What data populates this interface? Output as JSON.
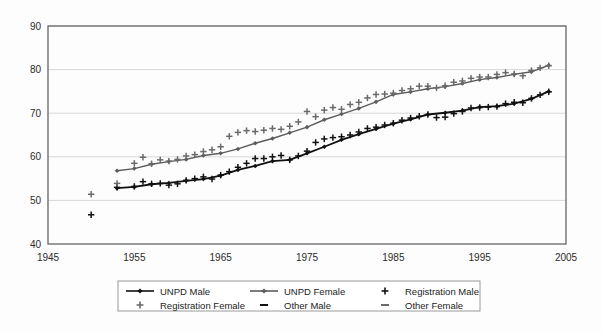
{
  "chart_data": {
    "type": "line",
    "title": "",
    "subtitle": "",
    "xlabel": "",
    "ylabel": "",
    "xlim": [
      1945,
      2005
    ],
    "ylim": [
      40,
      90
    ],
    "xticks": [
      1945,
      1955,
      1965,
      1975,
      1985,
      1995,
      2005
    ],
    "yticks": [
      40,
      50,
      60,
      70,
      80,
      90
    ],
    "grid": true,
    "legend_position": "bottom",
    "colors": {
      "unpd_male": "#111111",
      "unpd_female": "#5c5c5c",
      "registration_male": "#111111",
      "registration_female": "#6a6a6a",
      "gridline": "#d8d8d8",
      "frame": "#666666",
      "background": "#fdfdfd"
    },
    "series": [
      {
        "name": "UNPD Male",
        "marker": "diamond",
        "style": "line-with-markers",
        "color": "#111111",
        "x": [
          1953,
          1955,
          1957,
          1959,
          1961,
          1963,
          1965,
          1967,
          1969,
          1971,
          1973,
          1975,
          1977,
          1979,
          1981,
          1983,
          1985,
          1987,
          1989,
          1991,
          1993,
          1995,
          1997,
          1999,
          2001,
          2003
        ],
        "y": [
          52.8,
          53.1,
          53.7,
          54.0,
          54.5,
          54.9,
          55.7,
          57.0,
          57.9,
          59.0,
          59.3,
          60.8,
          62.3,
          63.9,
          65.2,
          66.4,
          67.6,
          68.6,
          69.7,
          70.1,
          70.6,
          71.4,
          71.6,
          72.2,
          73.3,
          75.0
        ]
      },
      {
        "name": "UNPD Female",
        "marker": "diamond",
        "style": "line-with-markers",
        "color": "#5c5c5c",
        "x": [
          1953,
          1955,
          1957,
          1959,
          1961,
          1963,
          1965,
          1967,
          1969,
          1971,
          1973,
          1975,
          1977,
          1979,
          1981,
          1983,
          1985,
          1987,
          1989,
          1991,
          1993,
          1995,
          1997,
          1999,
          2001,
          2003
        ],
        "y": [
          56.8,
          57.3,
          58.3,
          58.9,
          59.4,
          60.3,
          60.8,
          61.8,
          63.1,
          64.2,
          65.5,
          66.8,
          68.5,
          69.8,
          71.1,
          72.6,
          74.3,
          74.9,
          75.6,
          76.1,
          76.8,
          77.7,
          78.2,
          78.9,
          79.5,
          81.0
        ]
      },
      {
        "name": "Registration Male",
        "marker": "plus",
        "style": "markers-only",
        "color": "#111111",
        "x": [
          1950,
          1953,
          1955,
          1956,
          1957,
          1958,
          1959,
          1960,
          1961,
          1962,
          1963,
          1964,
          1965,
          1966,
          1967,
          1968,
          1969,
          1970,
          1971,
          1972,
          1973,
          1974,
          1975,
          1976,
          1977,
          1978,
          1979,
          1980,
          1981,
          1982,
          1983,
          1984,
          1985,
          1986,
          1987,
          1988,
          1989,
          1990,
          1991,
          1992,
          1993,
          1994,
          1995,
          1996,
          1997,
          1998,
          1999,
          2000,
          2001,
          2002,
          2003
        ],
        "y": [
          46.7,
          53.0,
          53.2,
          54.3,
          53.8,
          53.9,
          53.5,
          53.8,
          54.6,
          55.0,
          55.4,
          54.9,
          55.8,
          56.6,
          57.6,
          58.5,
          59.6,
          59.6,
          60.0,
          60.3,
          59.3,
          60.2,
          61.3,
          63.3,
          64.1,
          64.4,
          64.6,
          65.0,
          65.7,
          66.5,
          66.8,
          67.3,
          67.7,
          68.4,
          68.9,
          69.3,
          69.7,
          69.0,
          69.1,
          69.9,
          70.4,
          71.2,
          71.3,
          71.4,
          71.5,
          72.2,
          72.5,
          72.4,
          73.4,
          74.2,
          74.9
        ]
      },
      {
        "name": "Registration Female",
        "marker": "plus",
        "style": "markers-only",
        "color": "#6a6a6a",
        "x": [
          1950,
          1953,
          1955,
          1956,
          1957,
          1958,
          1959,
          1960,
          1961,
          1962,
          1963,
          1964,
          1965,
          1966,
          1967,
          1968,
          1969,
          1970,
          1971,
          1972,
          1973,
          1974,
          1975,
          1976,
          1977,
          1978,
          1979,
          1980,
          1981,
          1982,
          1983,
          1984,
          1985,
          1986,
          1987,
          1988,
          1989,
          1990,
          1991,
          1992,
          1993,
          1994,
          1995,
          1996,
          1997,
          1998,
          1999,
          2000,
          2001,
          2002,
          2003
        ],
        "y": [
          51.4,
          53.9,
          58.5,
          59.9,
          58.4,
          59.3,
          59.0,
          59.4,
          60.2,
          60.5,
          61.2,
          61.6,
          62.3,
          64.7,
          65.6,
          66.0,
          65.8,
          66.1,
          66.5,
          66.3,
          67.0,
          68.0,
          70.4,
          69.2,
          70.7,
          71.3,
          70.9,
          72.0,
          72.5,
          73.5,
          74.3,
          74.4,
          74.6,
          75.2,
          75.6,
          76.2,
          76.2,
          75.8,
          76.3,
          77.1,
          77.4,
          78.0,
          78.3,
          78.3,
          78.9,
          79.3,
          79.0,
          78.6,
          79.8,
          80.4,
          80.9
        ]
      },
      {
        "name": "Other Male",
        "marker": "dash",
        "style": "markers-only",
        "color": "#111111",
        "x": [],
        "y": []
      },
      {
        "name": "Other Female",
        "marker": "dash",
        "style": "markers-only",
        "color": "#6a6a6a",
        "x": [],
        "y": []
      }
    ]
  },
  "legend": {
    "entries": [
      {
        "label": "UNPD Male",
        "marker": "line-diamond",
        "color": "#111111"
      },
      {
        "label": "UNPD Female",
        "marker": "line-diamond",
        "color": "#5c5c5c"
      },
      {
        "label": "Registration Male",
        "marker": "plus",
        "color": "#111111"
      },
      {
        "label": "Registration Female",
        "marker": "plus",
        "color": "#6a6a6a"
      },
      {
        "label": "Other Male",
        "marker": "dash",
        "color": "#111111"
      },
      {
        "label": "Other Female",
        "marker": "dash",
        "color": "#6a6a6a"
      }
    ]
  }
}
